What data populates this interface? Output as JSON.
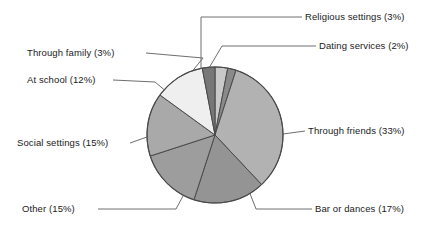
{
  "chart_data": {
    "type": "pie",
    "title": "",
    "xlabel": "",
    "ylabel": "",
    "legend_position": "callout-labels",
    "grid": false,
    "units": "percent",
    "total": 100,
    "categories": [
      "Religious settings",
      "Dating services",
      "Through friends",
      "Bar or dances",
      "Other",
      "Social settings",
      "At school",
      "Through family"
    ],
    "values": [
      3,
      2,
      33,
      17,
      15,
      15,
      12,
      3
    ],
    "slices": [
      {
        "label": "Religious settings",
        "value": 3,
        "label_text": "Religious settings (3%)",
        "color": "#c9c9c9"
      },
      {
        "label": "Dating services",
        "value": 2,
        "label_text": "Dating services (2%)",
        "color": "#8a8a8a"
      },
      {
        "label": "Through friends",
        "value": 33,
        "label_text": "Through friends (33%)",
        "color": "#b2b2b2"
      },
      {
        "label": "Bar or dances",
        "value": 17,
        "label_text": "Bar or dances (17%)",
        "color": "#949494"
      },
      {
        "label": "Other",
        "value": 15,
        "label_text": "Other (15%)",
        "color": "#9d9d9d"
      },
      {
        "label": "Social settings",
        "value": 15,
        "label_text": "Social settings (15%)",
        "color": "#a9a9a9"
      },
      {
        "label": "At school",
        "value": 12,
        "label_text": "At school (12%)",
        "color": "#efefef"
      },
      {
        "label": "Through family",
        "value": 3,
        "label_text": "Through family (3%)",
        "color": "#777777"
      }
    ],
    "start_angle_deg": 0,
    "direction": "clockwise",
    "outline_color": "#4a4a4a",
    "leader_line_color": "#6e6e6e"
  },
  "labels": {
    "religious_settings": "Religious settings (3%)",
    "dating_services": "Dating services (2%)",
    "through_friends": "Through friends (33%)",
    "bar_or_dances": "Bar or dances (17%)",
    "other": "Other (15%)",
    "social_settings": "Social settings (15%)",
    "at_school": "At school (12%)",
    "through_family": "Through family (3%)"
  }
}
